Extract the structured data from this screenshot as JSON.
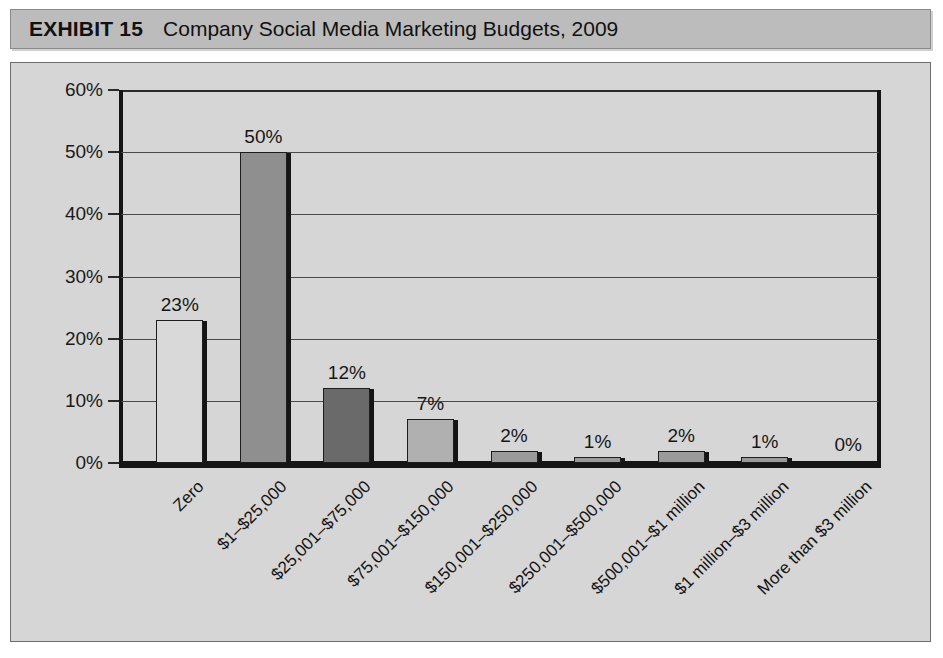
{
  "header": {
    "exhibit_label": "EXHIBIT 15",
    "title": "Company Social Media Marketing Budgets, 2009"
  },
  "colors": {
    "header_bar_bg": "#bcbcbc",
    "panel_bg": "#d6d6d6",
    "axis": "#151515",
    "gridline": "#4a4a4a",
    "text": "#131313",
    "bar_light": "#d9d9d9",
    "bar_medium": "#8f8f8f",
    "bar_dark": "#6a6a6a",
    "bar_midlight": "#b0b0b0"
  },
  "chart_data": {
    "type": "bar",
    "title": "Company Social Media Marketing Budgets, 2009",
    "xlabel": "",
    "ylabel": "",
    "ylim": [
      0,
      60
    ],
    "grid": true,
    "legend": "none",
    "ytick_labels": [
      "60%",
      "50%",
      "40%",
      "30%",
      "20%",
      "10%",
      "0%"
    ],
    "ytick_values": [
      60,
      50,
      40,
      30,
      20,
      10,
      0
    ],
    "categories": [
      "Zero",
      "$1–$25,000",
      "$25,001–$75,000",
      "$75,001–$150,000",
      "$150,001–$250,000",
      "$250,001–$500,000",
      "$500,001–$1 million",
      "$1 million–$3 million",
      "More than $3 million"
    ],
    "values": [
      23,
      50,
      12,
      7,
      2,
      1,
      2,
      1,
      0
    ],
    "data_labels": [
      "23%",
      "50%",
      "12%",
      "7%",
      "2%",
      "1%",
      "2%",
      "1%",
      "0%"
    ],
    "bar_colors": [
      "#d9d9d9",
      "#8f8f8f",
      "#6a6a6a",
      "#b0b0b0",
      "#9a9a9a",
      "#9a9a9a",
      "#9a9a9a",
      "#9a9a9a",
      "#9a9a9a"
    ]
  }
}
